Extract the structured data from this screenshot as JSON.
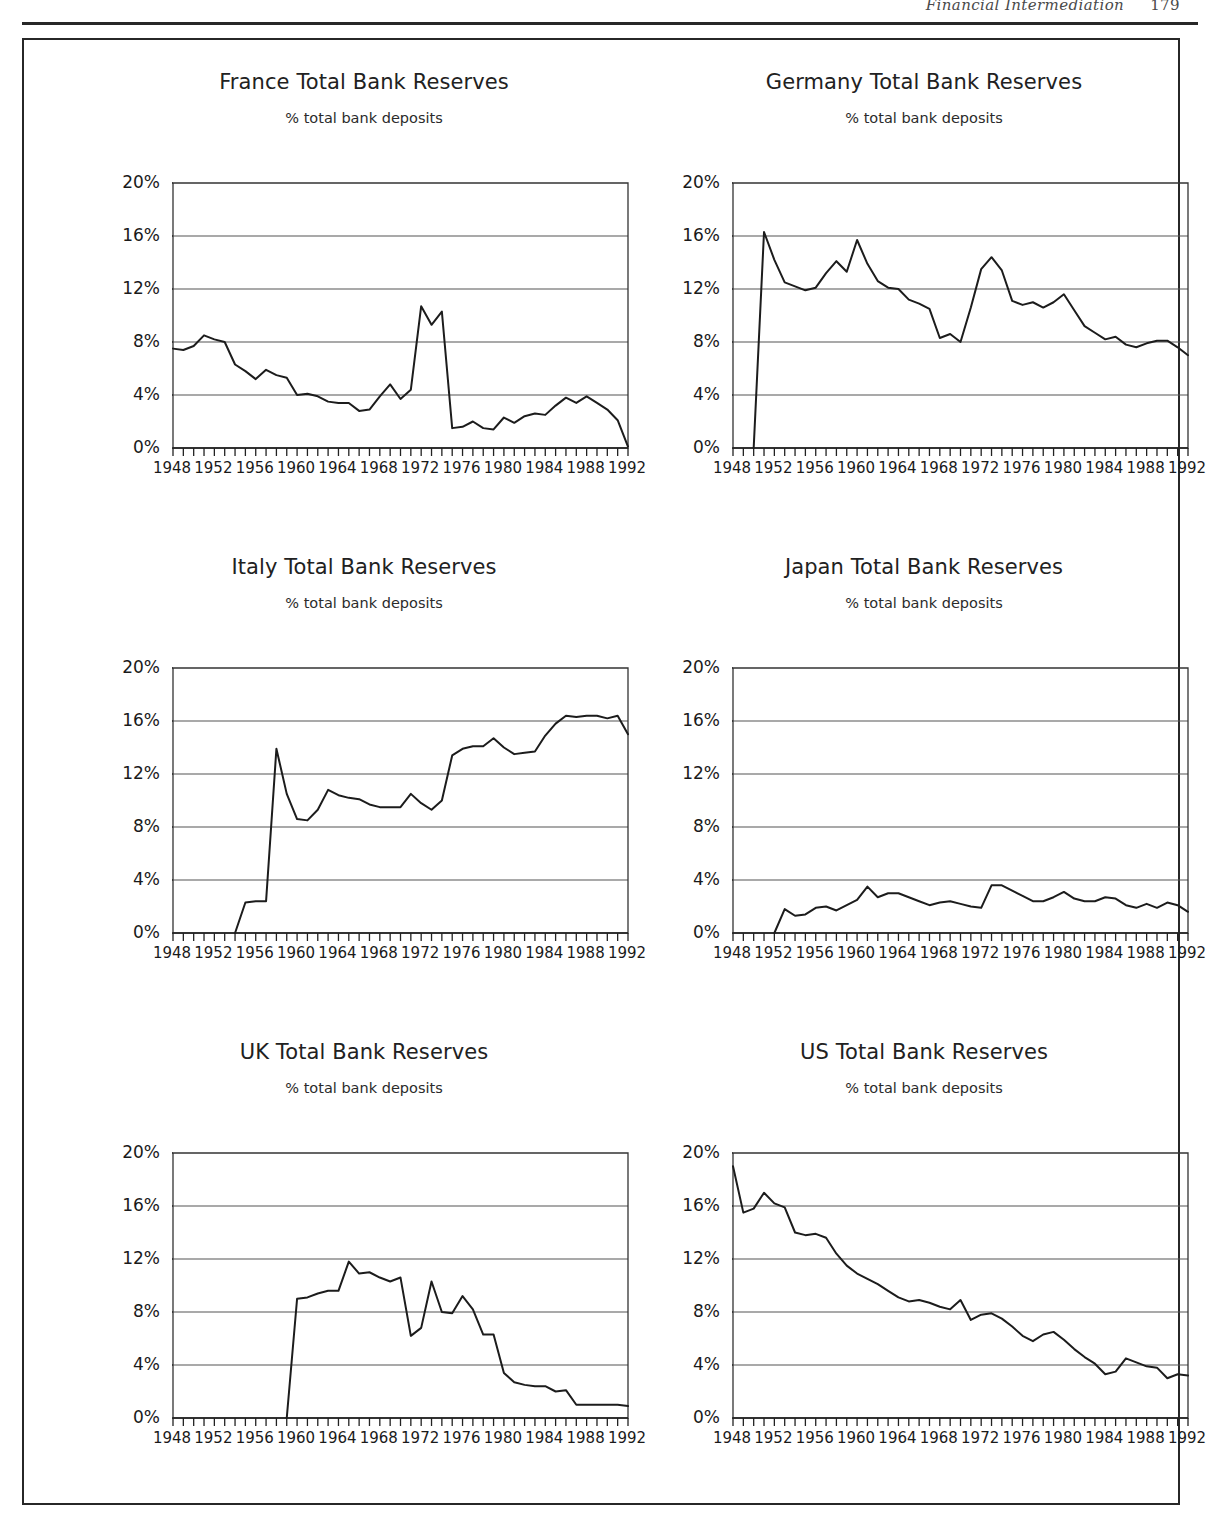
{
  "page": {
    "running_head": "Financial Intermediation",
    "page_number": "179"
  },
  "figure": {
    "common_subtitle": "% total bank deposits",
    "y_ticks": [
      "0%",
      "4%",
      "8%",
      "12%",
      "16%",
      "20%"
    ],
    "x_ticks": [
      "1948",
      "1952",
      "1956",
      "1960",
      "1964",
      "1968",
      "1972",
      "1976",
      "1980",
      "1984",
      "1988",
      "1992"
    ],
    "ylim": [
      0,
      20
    ],
    "xlim": [
      1948,
      1992
    ],
    "line_color": "#1c1c1c",
    "grid_color": "#555555"
  },
  "chart_data": [
    {
      "type": "line",
      "title": "France Total Bank Reserves",
      "subtitle": "% total bank deposits",
      "xlabel": "",
      "ylabel": "% total bank deposits",
      "ylim": [
        0,
        20
      ],
      "xlim": [
        1948,
        1992
      ],
      "grid": true,
      "legend": "none",
      "x": [
        1948,
        1949,
        1950,
        1951,
        1952,
        1953,
        1954,
        1955,
        1956,
        1957,
        1958,
        1959,
        1960,
        1961,
        1962,
        1963,
        1964,
        1965,
        1966,
        1967,
        1968,
        1969,
        1970,
        1971,
        1972,
        1973,
        1974,
        1975,
        1976,
        1977,
        1978,
        1979,
        1980,
        1981,
        1982,
        1983,
        1984,
        1985,
        1986,
        1987,
        1988,
        1989,
        1990,
        1991,
        1992
      ],
      "values": [
        7.5,
        7.4,
        7.7,
        8.5,
        8.2,
        8.0,
        6.3,
        5.8,
        5.2,
        5.9,
        5.5,
        5.3,
        4.0,
        4.1,
        3.9,
        3.5,
        3.4,
        3.4,
        2.8,
        2.9,
        3.9,
        4.8,
        3.7,
        4.4,
        10.7,
        9.3,
        10.3,
        1.5,
        1.6,
        2.0,
        1.5,
        1.4,
        2.3,
        1.9,
        2.4,
        2.6,
        2.5,
        3.2,
        3.8,
        3.4,
        3.9,
        3.4,
        2.9,
        2.1,
        0.1
      ]
    },
    {
      "type": "line",
      "title": "Germany Total Bank Reserves",
      "subtitle": "% total bank deposits",
      "xlabel": "",
      "ylabel": "% total bank deposits",
      "ylim": [
        0,
        20
      ],
      "xlim": [
        1948,
        1992
      ],
      "grid": true,
      "legend": "none",
      "x": [
        1950,
        1951,
        1952,
        1953,
        1954,
        1955,
        1956,
        1957,
        1958,
        1959,
        1960,
        1961,
        1962,
        1963,
        1964,
        1965,
        1966,
        1967,
        1968,
        1969,
        1970,
        1971,
        1972,
        1973,
        1974,
        1975,
        1976,
        1977,
        1978,
        1979,
        1980,
        1981,
        1982,
        1983,
        1984,
        1985,
        1986,
        1987,
        1988,
        1989,
        1990,
        1991,
        1992
      ],
      "values": [
        0.0,
        16.3,
        14.2,
        12.5,
        12.2,
        11.9,
        12.1,
        13.2,
        14.1,
        13.3,
        15.7,
        13.9,
        12.6,
        12.1,
        12.0,
        11.2,
        10.9,
        10.5,
        8.3,
        8.6,
        8.0,
        10.6,
        13.5,
        14.4,
        13.4,
        11.1,
        10.8,
        11.0,
        10.6,
        11.0,
        11.6,
        10.4,
        9.2,
        8.7,
        8.2,
        8.4,
        7.8,
        7.6,
        7.9,
        8.1,
        8.1,
        7.6,
        7.0
      ]
    },
    {
      "type": "line",
      "title": "Italy Total Bank Reserves",
      "subtitle": "% total bank deposits",
      "xlabel": "",
      "ylabel": "% total bank deposits",
      "ylim": [
        0,
        20
      ],
      "xlim": [
        1948,
        1992
      ],
      "grid": true,
      "legend": "none",
      "x": [
        1954,
        1955,
        1956,
        1957,
        1958,
        1959,
        1960,
        1961,
        1962,
        1963,
        1964,
        1965,
        1966,
        1967,
        1968,
        1969,
        1970,
        1971,
        1972,
        1973,
        1974,
        1975,
        1976,
        1977,
        1978,
        1979,
        1980,
        1981,
        1982,
        1983,
        1984,
        1985,
        1986,
        1987,
        1988,
        1989,
        1990,
        1991,
        1992
      ],
      "values": [
        0.0,
        2.3,
        2.4,
        2.4,
        13.9,
        10.5,
        8.6,
        8.5,
        9.3,
        10.8,
        10.4,
        10.2,
        10.1,
        9.7,
        9.5,
        9.5,
        9.5,
        10.5,
        9.8,
        9.3,
        10.0,
        13.4,
        13.9,
        14.1,
        14.1,
        14.7,
        14.0,
        13.5,
        13.6,
        13.7,
        14.9,
        15.8,
        16.4,
        16.3,
        16.4,
        16.4,
        16.2,
        16.4,
        15.0
      ]
    },
    {
      "type": "line",
      "title": "Japan Total Bank Reserves",
      "subtitle": "% total bank deposits",
      "xlabel": "",
      "ylabel": "% total bank deposits",
      "ylim": [
        0,
        20
      ],
      "xlim": [
        1948,
        1992
      ],
      "grid": true,
      "legend": "none",
      "x": [
        1952,
        1953,
        1954,
        1955,
        1956,
        1957,
        1958,
        1959,
        1960,
        1961,
        1962,
        1963,
        1964,
        1965,
        1966,
        1967,
        1968,
        1969,
        1970,
        1971,
        1972,
        1973,
        1974,
        1975,
        1976,
        1977,
        1978,
        1979,
        1980,
        1981,
        1982,
        1983,
        1984,
        1985,
        1986,
        1987,
        1988,
        1989,
        1990,
        1991,
        1992
      ],
      "values": [
        0.0,
        1.8,
        1.3,
        1.4,
        1.9,
        2.0,
        1.7,
        2.1,
        2.5,
        3.5,
        2.7,
        3.0,
        3.0,
        2.7,
        2.4,
        2.1,
        2.3,
        2.4,
        2.2,
        2.0,
        1.9,
        3.6,
        3.6,
        3.2,
        2.8,
        2.4,
        2.4,
        2.7,
        3.1,
        2.6,
        2.4,
        2.4,
        2.7,
        2.6,
        2.1,
        1.9,
        2.2,
        1.9,
        2.3,
        2.1,
        1.6
      ]
    },
    {
      "type": "line",
      "title": "UK Total Bank Reserves",
      "subtitle": "% total bank deposits",
      "xlabel": "",
      "ylabel": "% total bank deposits",
      "ylim": [
        0,
        20
      ],
      "xlim": [
        1948,
        1992
      ],
      "grid": true,
      "legend": "none",
      "x": [
        1959,
        1960,
        1961,
        1962,
        1963,
        1964,
        1965,
        1966,
        1967,
        1968,
        1969,
        1970,
        1971,
        1972,
        1973,
        1974,
        1975,
        1976,
        1977,
        1978,
        1979,
        1980,
        1981,
        1982,
        1983,
        1984,
        1985,
        1986,
        1987,
        1988,
        1989,
        1990,
        1991,
        1992
      ],
      "values": [
        0.0,
        9.0,
        9.1,
        9.4,
        9.6,
        9.6,
        11.8,
        10.9,
        11.0,
        10.6,
        10.3,
        10.6,
        6.2,
        6.8,
        10.3,
        8.0,
        7.9,
        9.2,
        8.2,
        6.3,
        6.3,
        3.4,
        2.7,
        2.5,
        2.4,
        2.4,
        2.0,
        2.1,
        1.0,
        1.0,
        1.0,
        1.0,
        1.0,
        0.9
      ]
    },
    {
      "type": "line",
      "title": "US Total Bank Reserves",
      "subtitle": "% total bank deposits",
      "xlabel": "",
      "ylabel": "% total bank deposits",
      "ylim": [
        0,
        20
      ],
      "xlim": [
        1948,
        1992
      ],
      "grid": true,
      "legend": "none",
      "x": [
        1948,
        1949,
        1950,
        1951,
        1952,
        1953,
        1954,
        1955,
        1956,
        1957,
        1958,
        1959,
        1960,
        1961,
        1962,
        1963,
        1964,
        1965,
        1966,
        1967,
        1968,
        1969,
        1970,
        1971,
        1972,
        1973,
        1974,
        1975,
        1976,
        1977,
        1978,
        1979,
        1980,
        1981,
        1982,
        1983,
        1984,
        1985,
        1986,
        1987,
        1988,
        1989,
        1990,
        1991,
        1992
      ],
      "values": [
        19.0,
        15.5,
        15.8,
        17.0,
        16.2,
        15.9,
        14.0,
        13.8,
        13.9,
        13.6,
        12.4,
        11.5,
        10.9,
        10.5,
        10.1,
        9.6,
        9.1,
        8.8,
        8.9,
        8.7,
        8.4,
        8.2,
        8.9,
        7.4,
        7.8,
        7.9,
        7.5,
        6.9,
        6.2,
        5.8,
        6.3,
        6.5,
        5.9,
        5.2,
        4.6,
        4.1,
        3.3,
        3.5,
        4.5,
        4.2,
        3.9,
        3.8,
        3.0,
        3.3,
        3.2
      ]
    }
  ]
}
